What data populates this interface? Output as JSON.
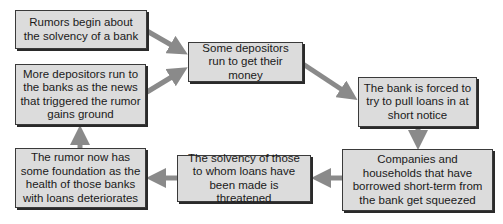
{
  "diagram": {
    "type": "cycle-flowchart",
    "colors": {
      "box_fill": "#dcdcdc",
      "box_border": "#3a3a3a",
      "arrow": "#8a8a8a"
    },
    "nodes": [
      {
        "id": "n1",
        "text": "Rumors begin about the solvency of a bank"
      },
      {
        "id": "n2",
        "text": "Some depositors run to get their money"
      },
      {
        "id": "n3",
        "text": "The bank is forced to try to pull loans in at short notice"
      },
      {
        "id": "n4",
        "text": "Companies and households that have borrowed short-term from the bank get squeezed"
      },
      {
        "id": "n5",
        "text": "The solvency of those to whom loans have been made is threatened"
      },
      {
        "id": "n6",
        "text": "The rumor now has some foundation as the health of those banks with loans deteriorates"
      },
      {
        "id": "n7",
        "text": "More depositors run to the banks as the news that triggered the rumor gains ground"
      }
    ],
    "edges": [
      {
        "from": "n1",
        "to": "n2"
      },
      {
        "from": "n7",
        "to": "n2"
      },
      {
        "from": "n2",
        "to": "n3"
      },
      {
        "from": "n3",
        "to": "n4"
      },
      {
        "from": "n4",
        "to": "n5"
      },
      {
        "from": "n5",
        "to": "n6"
      },
      {
        "from": "n6",
        "to": "n7"
      }
    ]
  }
}
